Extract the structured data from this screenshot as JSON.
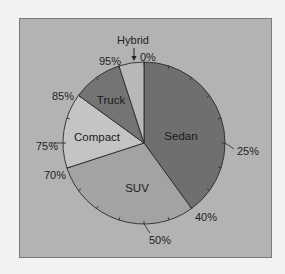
{
  "chart_data": {
    "type": "pie",
    "title": "",
    "start_angle_deg": 0,
    "direction": "clockwise",
    "categories": [
      "Sedan",
      "SUV",
      "Compact",
      "Truck",
      "Hybrid"
    ],
    "values": [
      40,
      30,
      15,
      10,
      5
    ],
    "cumulative_boundaries": [
      0,
      40,
      70,
      85,
      95,
      100
    ],
    "colors": [
      "#6f6f6f",
      "#a3a3a3",
      "#c4c4c4",
      "#747474",
      "#b8b8b8"
    ],
    "perimeter_labels": [
      {
        "text": "0%",
        "value": 0
      },
      {
        "text": "25%",
        "value": 25
      },
      {
        "text": "40%",
        "value": 40
      },
      {
        "text": "50%",
        "value": 50
      },
      {
        "text": "70%",
        "value": 70
      },
      {
        "text": "75%",
        "value": 75
      },
      {
        "text": "85%",
        "value": 85
      },
      {
        "text": "95%",
        "value": 95
      }
    ],
    "tick_interval_pct": 5,
    "annotations": [
      {
        "text": "Hybrid",
        "points_to": "Hybrid slice",
        "arrow": true
      }
    ],
    "legend": "none (labels on slices)"
  },
  "labels": {
    "sedan": "Sedan",
    "suv": "SUV",
    "compact": "Compact",
    "truck": "Truck",
    "hybrid": "Hybrid",
    "p0": "0%",
    "p25": "25%",
    "p40": "40%",
    "p50": "50%",
    "p70": "70%",
    "p75": "75%",
    "p85": "85%",
    "p95": "95%"
  }
}
